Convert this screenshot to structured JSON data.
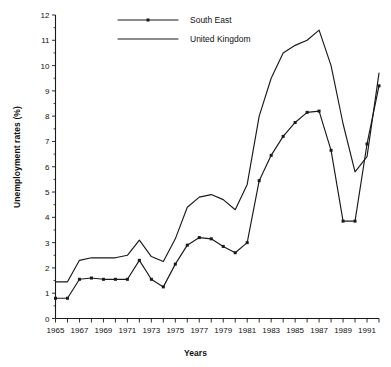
{
  "chart_data": {
    "type": "line",
    "title": "",
    "xlabel": "Years",
    "ylabel": "Unemployment rates (%)",
    "xlim": [
      1965,
      1992
    ],
    "ylim": [
      0,
      12
    ],
    "yticks": [
      0,
      1,
      2,
      3,
      4,
      5,
      6,
      7,
      8,
      9,
      10,
      11,
      12
    ],
    "ytick_labels": [
      "0",
      "1",
      "2",
      "3",
      "4",
      "5",
      "6",
      "7",
      "8",
      "9",
      "10",
      "11",
      "12"
    ],
    "xticks": [
      1965,
      1966,
      1967,
      1968,
      1969,
      1970,
      1971,
      1972,
      1973,
      1974,
      1975,
      1976,
      1977,
      1978,
      1979,
      1980,
      1981,
      1982,
      1983,
      1984,
      1985,
      1986,
      1987,
      1988,
      1989,
      1990,
      1991,
      1992
    ],
    "xtick_labels_shown": [
      "1965",
      "1967",
      "1969",
      "1971",
      "1973",
      "1975",
      "1977",
      "1979",
      "1981",
      "1983",
      "1985",
      "1987",
      "1989",
      "1991"
    ],
    "xtick_label_step": 2,
    "grid": false,
    "legend_position": "top-left",
    "x": [
      1965,
      1966,
      1967,
      1968,
      1969,
      1970,
      1971,
      1972,
      1973,
      1974,
      1975,
      1976,
      1977,
      1978,
      1979,
      1980,
      1981,
      1982,
      1983,
      1984,
      1985,
      1986,
      1987,
      1988,
      1989,
      1990,
      1991,
      1992
    ],
    "series": [
      {
        "name": "South East",
        "markers": true,
        "values": [
          0.8,
          0.8,
          1.55,
          1.6,
          1.55,
          1.55,
          1.55,
          2.3,
          1.55,
          1.25,
          2.15,
          2.9,
          3.2,
          3.15,
          2.85,
          2.6,
          3.0,
          5.45,
          6.45,
          7.2,
          7.75,
          8.15,
          8.2,
          6.65,
          3.85,
          3.85,
          6.9,
          9.2
        ]
      },
      {
        "name": "United Kingdom",
        "markers": false,
        "values": [
          1.45,
          1.45,
          2.3,
          2.4,
          2.4,
          2.4,
          2.5,
          3.1,
          2.45,
          2.25,
          3.15,
          4.4,
          4.8,
          4.9,
          4.7,
          4.3,
          5.3,
          8.0,
          9.5,
          10.5,
          10.8,
          11.0,
          11.4,
          10.0,
          7.7,
          5.8,
          6.4,
          9.7
        ]
      }
    ],
    "legend": [
      {
        "label": "South East",
        "marker": true
      },
      {
        "label": "United Kingdom",
        "marker": false
      }
    ],
    "colors": {
      "line": "#1a1a1a",
      "axis": "#1a1a1a",
      "background": "#ffffff"
    }
  }
}
